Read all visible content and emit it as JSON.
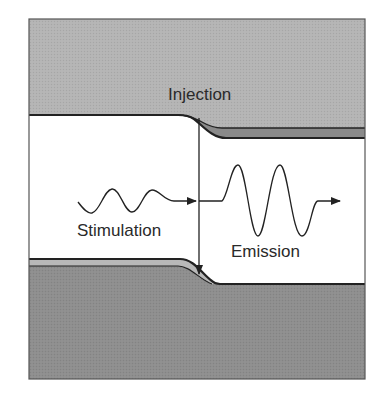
{
  "diagram": {
    "type": "stimulated-emission-band-diagram",
    "labels": {
      "injection": "Injection",
      "stimulation": "Stimulation",
      "emission": "Emission"
    },
    "colors": {
      "upper_region": "#b4b4b4",
      "lower_region": "#8e8e8e",
      "upper_band": "#8a8a8a",
      "lower_band": "#b8b8b8",
      "gap": "#ffffff",
      "line": "#222222",
      "frame": "#555555"
    }
  }
}
